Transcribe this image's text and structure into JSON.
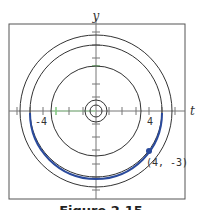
{
  "figure": {
    "axes": {
      "x_label": "t",
      "y_label": "y"
    },
    "tick_labels": {
      "left": "-4",
      "right": "4"
    },
    "point": {
      "label": "(4, -3)",
      "t": 4,
      "y": -3
    },
    "caption": "Figure 2.15",
    "colors": {
      "solution": "#2a4a9c",
      "equilibrium_marks": "#7fc77f",
      "curves": "#333333"
    },
    "level_curves_radii": [
      0.45,
      0.85,
      3.4,
      5,
      5.75
    ],
    "highlighted_curve": {
      "radius": 5,
      "portion": "lower semicircle"
    }
  }
}
